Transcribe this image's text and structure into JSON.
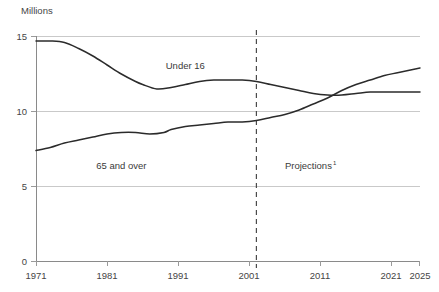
{
  "chart_data": {
    "type": "line",
    "title": "",
    "ylabel": "Millions",
    "xlabel": "",
    "ylim": [
      0,
      15
    ],
    "xlim": [
      1971,
      2025
    ],
    "grid": true,
    "legend_position": "inline-annotation",
    "y_ticks": [
      0,
      5,
      10,
      15
    ],
    "y_tick_labels": [
      "0",
      "5",
      "10",
      "15"
    ],
    "x_ticks": [
      1971,
      1981,
      1991,
      2001,
      2011,
      2021,
      2025
    ],
    "x_tick_labels": [
      "1971",
      "1981",
      "1991",
      "2001",
      "2011",
      "2021",
      "2025"
    ],
    "annotations": [
      {
        "text": "Projections",
        "superscript": "1",
        "x": 2006,
        "y": 6.2
      }
    ],
    "projection_start_year": 2002,
    "series": [
      {
        "name": "Under 16",
        "label_x": 1992,
        "label_y": 12.85,
        "x": [
          1971,
          1973,
          1975,
          1977,
          1979,
          1981,
          1983,
          1985,
          1986,
          1988,
          1990,
          1992,
          1994,
          1996,
          1998,
          2000,
          2002,
          2004,
          2006,
          2008,
          2010,
          2012,
          2014,
          2016,
          2018,
          2020,
          2022,
          2025
        ],
        "values": [
          14.7,
          14.7,
          14.6,
          14.2,
          13.7,
          13.1,
          12.5,
          12.0,
          11.8,
          11.5,
          11.6,
          11.8,
          12.0,
          12.1,
          12.1,
          12.1,
          12.0,
          11.8,
          11.6,
          11.4,
          11.2,
          11.1,
          11.1,
          11.2,
          11.3,
          11.3,
          11.3,
          11.3
        ]
      },
      {
        "name": "65 and over",
        "label_x": 1983,
        "label_y": 6.2,
        "x": [
          1971,
          1973,
          1975,
          1977,
          1979,
          1981,
          1983,
          1985,
          1987,
          1989,
          1990,
          1992,
          1994,
          1996,
          1998,
          2000,
          2002,
          2004,
          2006,
          2008,
          2010,
          2012,
          2014,
          2016,
          2018,
          2020,
          2022,
          2025
        ],
        "values": [
          7.4,
          7.6,
          7.9,
          8.1,
          8.3,
          8.5,
          8.6,
          8.6,
          8.5,
          8.6,
          8.8,
          9.0,
          9.1,
          9.2,
          9.3,
          9.3,
          9.4,
          9.6,
          9.8,
          10.1,
          10.5,
          10.9,
          11.4,
          11.8,
          12.1,
          12.4,
          12.6,
          12.9
        ]
      }
    ]
  },
  "axis": {
    "y_title": "Millions"
  }
}
